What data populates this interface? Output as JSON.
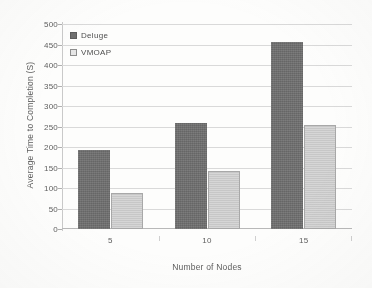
{
  "chart_data": {
    "type": "bar",
    "title": "",
    "subtitle": "",
    "xlabel": "Number of Nodes",
    "ylabel": "Average Time to Completion (S)",
    "categories": [
      "5",
      "10",
      "15"
    ],
    "series": [
      {
        "name": "Deluge",
        "color": "#6f6f6f",
        "values": [
          193,
          258,
          457
        ]
      },
      {
        "name": "VMOAP",
        "color": "#cdcdcd",
        "values": [
          88,
          142,
          254
        ]
      }
    ],
    "ylim": [
      0,
      500
    ],
    "ytick_step": 50,
    "yticks": [
      "500",
      "450",
      "400",
      "350",
      "300",
      "250",
      "200",
      "150",
      "100",
      "50",
      "0"
    ],
    "grid": "horizontal",
    "legend_position": "top-left-inside",
    "legend": [
      {
        "label": "Deluge",
        "swatch": "filled-dark-square"
      },
      {
        "label": "VMOAP",
        "swatch": "outlined-light-square"
      }
    ]
  }
}
